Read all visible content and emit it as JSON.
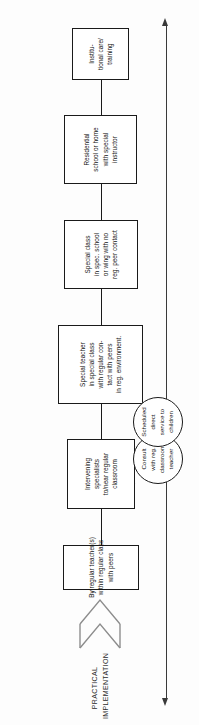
{
  "diagram": {
    "orientation": "rotated-90-ccw",
    "background_color": "#fdfdfd",
    "line_color": "#1a1a1a",
    "caption": {
      "line1": "PRACTICAL",
      "line2": "IMPLEMENTATION"
    },
    "axis_arrow": {
      "name": "double-headed-continuum-arrow",
      "color": "#3a3a3a",
      "heads": 2
    },
    "open_arrow": {
      "name": "open-chevron-up-arrow",
      "color": "#8a8a8a"
    },
    "nodes": [
      {
        "id": "regular-teacher",
        "lines": [
          "By regular teacher(s)",
          "within regular class",
          "with peers"
        ]
      },
      {
        "id": "intervening-specialists",
        "lines": [
          "Intervening",
          "specialists",
          "to/near regular",
          "classroom"
        ]
      },
      {
        "id": "special-teacher",
        "lines": [
          "Special teacher",
          "in special class",
          "with regular con-",
          "tact with peers",
          "in reg. environment."
        ]
      },
      {
        "id": "special-class",
        "lines": [
          "Special class",
          "in spec. school",
          "or wing with no",
          "reg. peer contact"
        ]
      },
      {
        "id": "residential-school",
        "lines": [
          "Residential",
          "school or home",
          "with special",
          "instructor"
        ]
      },
      {
        "id": "institutional-care",
        "lines": [
          "Institu-",
          "tional care/",
          "training"
        ]
      }
    ],
    "circles": [
      {
        "id": "consult-reg-classroom-teacher",
        "lines": [
          "Consult",
          "with reg.",
          "classroom",
          "teacher"
        ]
      },
      {
        "id": "scheduled-direct-service",
        "lines": [
          "Scheduled",
          "direct",
          "service to",
          "children"
        ]
      }
    ]
  }
}
